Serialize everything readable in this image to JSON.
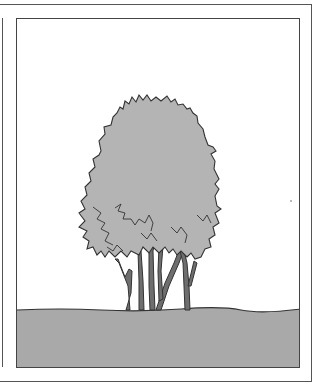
{
  "illustration": {
    "subject": "multi-stemmed shrub",
    "colors": {
      "sky": "#ffffff",
      "ground": "#a9a9a9",
      "foliage": "#b4b4b4",
      "trunk": "#6e6e6e",
      "outline": "#333333",
      "frame": "#444444"
    }
  }
}
